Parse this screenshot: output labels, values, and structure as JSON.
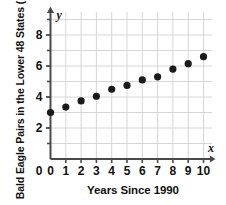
{
  "chart_data": {
    "type": "scatter",
    "title": "",
    "xlabel": "Years Since 1990",
    "ylabel": "Bald Eagle Pairs in the Lower 48 States (1000s)",
    "x_axis_variable": "x",
    "y_axis_variable": "y",
    "xlim": [
      0,
      10.6
    ],
    "ylim": [
      0,
      9.5
    ],
    "grid": true,
    "legend": null,
    "x_tick_labels": [
      "0",
      "1",
      "2",
      "3",
      "4",
      "5",
      "6",
      "7",
      "8",
      "9",
      "10"
    ],
    "x_ticks": [
      0,
      1,
      2,
      3,
      4,
      5,
      6,
      7,
      8,
      9,
      10
    ],
    "y_tick_labels": [
      "0",
      "2",
      "4",
      "6",
      "8"
    ],
    "y_ticks": [
      0,
      2,
      4,
      6,
      8
    ],
    "y_minor_ticks": [
      1,
      3,
      5,
      7,
      9
    ],
    "x": [
      0,
      1,
      2,
      3,
      4,
      5,
      6,
      7,
      8,
      9,
      10
    ],
    "values": [
      3.0,
      3.35,
      3.75,
      4.05,
      4.5,
      4.75,
      5.1,
      5.3,
      5.8,
      6.15,
      6.6
    ],
    "point_color": "#1a1a1a",
    "grid_color": "#d6d6d6",
    "axis_color": "#4a4a4a"
  }
}
